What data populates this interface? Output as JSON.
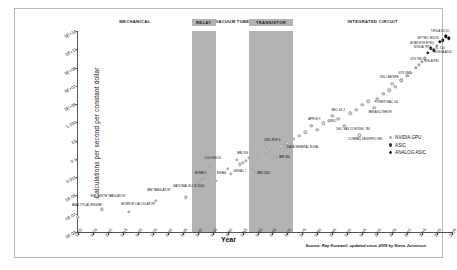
{
  "chart_data": {
    "type": "scatter",
    "title": "",
    "xlabel": "Year",
    "ylabel": "Calculations per second per constant dollar",
    "xlim": [
      1900,
      2025
    ],
    "ylim": [
      -9,
      13
    ],
    "grid": false,
    "yscale": "log",
    "legend_position": "right-middle",
    "source": "Source: Ray Kurzweil, updated since 2008 by Steve Jurvetson",
    "ytick_labels": [
      "1E+13",
      "1E+11",
      "1E+09",
      "1E+07",
      "1E+05",
      "1,000",
      "10",
      "0.1",
      "0.001",
      "1E-05",
      "1E-07",
      "1E-09"
    ],
    "ytick_exponents": [
      13,
      11,
      9,
      7,
      5,
      3,
      1,
      -1,
      -3,
      -5,
      -7,
      -9
    ],
    "xtick_labels": [
      "1900",
      "1905",
      "1910",
      "1915",
      "1920",
      "1925",
      "1930",
      "1935",
      "1940",
      "1945",
      "1950",
      "1955",
      "1960",
      "1965",
      "1970",
      "1975",
      "1980",
      "1985",
      "1990",
      "1995",
      "2000",
      "2005",
      "2010",
      "2015",
      "2020",
      "2025"
    ],
    "eras": [
      {
        "name": "MECHANICAL",
        "start": 1900,
        "end": 1938,
        "shaded": false
      },
      {
        "name": "RELAY",
        "start": 1938,
        "end": 1946,
        "shaded": true
      },
      {
        "name": "VACUUM TUBE",
        "start": 1946,
        "end": 1957,
        "shaded": false
      },
      {
        "name": "TRANSISTOR",
        "start": 1957,
        "end": 1972,
        "shaded": true
      },
      {
        "name": "INTEGRATED CIRCUIT",
        "start": 1972,
        "end": 2025,
        "shaded": false
      }
    ],
    "legend": [
      {
        "label": "NVIDIA GPU",
        "kind": "nvidia"
      },
      {
        "label": "ASIC",
        "kind": "asic"
      },
      {
        "label": "ANALOG ASIC",
        "kind": "analog"
      }
    ],
    "points": [
      {
        "name": "ANALYTICAL ENGINE",
        "year": 1900,
        "exp": -7.4,
        "kind": "plain",
        "lx": 1903,
        "ly": -6.1
      },
      {
        "name": "HOLLERITH TABULATOR",
        "year": 1908,
        "exp": -6.5,
        "kind": "plain",
        "lx": 1910,
        "ly": -5.2
      },
      {
        "name": "MONROE CALCULATOR",
        "year": 1917,
        "exp": -6.8,
        "kind": "plain",
        "lx": 1920,
        "ly": -6.0
      },
      {
        "name": "IBM TABULATOR",
        "year": 1926,
        "exp": -5.6,
        "kind": "plain",
        "lx": 1927,
        "ly": -4.5
      },
      {
        "name": "NATIONAL ELLIS 3000",
        "year": 1936,
        "exp": -5.2,
        "kind": "plain",
        "lx": 1937,
        "ly": -4.1
      },
      {
        "name": "BOMB II",
        "year": 1940,
        "exp": -3.6,
        "kind": "plain",
        "lx": 1941,
        "ly": -2.7
      },
      {
        "name": "",
        "year": 1941,
        "exp": -3.3,
        "kind": "plain"
      },
      {
        "name": "",
        "year": 1942,
        "exp": -3.1,
        "kind": "plain"
      },
      {
        "name": "ZUSE 3",
        "year": 1943,
        "exp": -2.9,
        "kind": "plain"
      },
      {
        "name": "COLOSSUS",
        "year": 1944,
        "exp": -1.8,
        "kind": "plain",
        "lx": 1945,
        "ly": -1.0
      },
      {
        "name": "ENIAC",
        "year": 1946,
        "exp": -3.4,
        "kind": "plain",
        "lx": 1948,
        "ly": -2.6
      },
      {
        "name": "",
        "year": 1949,
        "exp": -2.5,
        "kind": "plain"
      },
      {
        "name": "",
        "year": 1950,
        "exp": -2.1,
        "kind": "plain"
      },
      {
        "name": "UNIVAC I",
        "year": 1951,
        "exp": -2.6,
        "kind": "plain",
        "lx": 1954,
        "ly": -2.4
      },
      {
        "name": "IBM 704",
        "year": 1953,
        "exp": -1.1,
        "kind": "plain",
        "lx": 1955,
        "ly": -0.5
      },
      {
        "name": "",
        "year": 1954,
        "exp": -1.6,
        "kind": "plain"
      },
      {
        "name": "",
        "year": 1955,
        "exp": -1.4,
        "kind": "plain"
      },
      {
        "name": "",
        "year": 1956,
        "exp": -1.2,
        "kind": "plain"
      },
      {
        "name": "",
        "year": 1957,
        "exp": -0.9,
        "kind": "plain"
      },
      {
        "name": "",
        "year": 1958,
        "exp": -1.9,
        "kind": "plain"
      },
      {
        "name": "IBM 1620",
        "year": 1959,
        "exp": -2.4,
        "kind": "plain",
        "lx": 1962,
        "ly": -2.6
      },
      {
        "name": "",
        "year": 1960,
        "exp": -0.6,
        "kind": "plain"
      },
      {
        "name": "DEC PDP-4",
        "year": 1962,
        "exp": 0.6,
        "kind": "plain",
        "lx": 1965,
        "ly": 1.0
      },
      {
        "name": "",
        "year": 1963,
        "exp": -0.2,
        "kind": "plain"
      },
      {
        "name": "",
        "year": 1964,
        "exp": 0.1,
        "kind": "plain"
      },
      {
        "name": "IBM 360",
        "year": 1966,
        "exp": -0.8,
        "kind": "plain",
        "lx": 1969,
        "ly": -0.9
      },
      {
        "name": "",
        "year": 1968,
        "exp": 0.4,
        "kind": "plain"
      },
      {
        "name": "DATA GENERAL NOVA",
        "year": 1970,
        "exp": 0.7,
        "kind": "plain",
        "lx": 1975,
        "ly": 0.2
      },
      {
        "name": "",
        "year": 1972,
        "exp": 1.2,
        "kind": "plain"
      },
      {
        "name": "",
        "year": 1974,
        "exp": 1.5,
        "kind": "plain"
      },
      {
        "name": "",
        "year": 1976,
        "exp": 1.9,
        "kind": "plain"
      },
      {
        "name": "APPLE II",
        "year": 1978,
        "exp": 2.6,
        "kind": "plain",
        "lx": 1979,
        "ly": 3.3
      },
      {
        "name": "",
        "year": 1980,
        "exp": 2.2,
        "kind": "plain"
      },
      {
        "name": "SUN-1",
        "year": 1982,
        "exp": 2.9,
        "kind": "plain",
        "lx": 1985,
        "ly": 3.0
      },
      {
        "name": "",
        "year": 1984,
        "exp": 3.2,
        "kind": "plain"
      },
      {
        "name": "NEC SX-2",
        "year": 1985,
        "exp": 3.7,
        "kind": "plain",
        "lx": 1987,
        "ly": 4.2
      },
      {
        "name": "IBM PS/2",
        "year": 1987,
        "exp": 3.4,
        "kind": "plain"
      },
      {
        "name": "DEC VAX 11 MODEL 780",
        "year": 1989,
        "exp": 2.6,
        "kind": "plain",
        "lx": 1992,
        "ly": 2.2
      },
      {
        "name": "",
        "year": 1991,
        "exp": 4.0,
        "kind": "plain"
      },
      {
        "name": "",
        "year": 1993,
        "exp": 4.4,
        "kind": "plain"
      },
      {
        "name": "COMPAQ DESKPRO 386",
        "year": 1994,
        "exp": 1.6,
        "kind": "plain",
        "lx": 1996,
        "ly": 1.1
      },
      {
        "name": "",
        "year": 1995,
        "exp": 4.9,
        "kind": "plain"
      },
      {
        "name": "",
        "year": 1997,
        "exp": 5.3,
        "kind": "plain"
      },
      {
        "name": "IBM ASCI WHITE",
        "year": 1999,
        "exp": 4.6,
        "kind": "plain",
        "lx": 2001,
        "ly": 4.0
      },
      {
        "name": "POWER MAC G4",
        "year": 2000,
        "exp": 5.6,
        "kind": "plain",
        "lx": 2003,
        "ly": 5.1
      },
      {
        "name": "",
        "year": 2002,
        "exp": 6.1,
        "kind": "plain"
      },
      {
        "name": "",
        "year": 2004,
        "exp": 6.5,
        "kind": "plain"
      },
      {
        "name": "CELL BE/SPE",
        "year": 2005,
        "exp": 7.2,
        "kind": "plain",
        "lx": 2004,
        "ly": 7.9
      },
      {
        "name": "",
        "year": 2006,
        "exp": 6.9,
        "kind": "plain"
      },
      {
        "name": "GTX 580",
        "year": 2008,
        "exp": 7.6,
        "kind": "nvidia",
        "lx": 2009,
        "ly": 8.3
      },
      {
        "name": "",
        "year": 2010,
        "exp": 8.1,
        "kind": "nvidia"
      },
      {
        "name": "",
        "year": 2011,
        "exp": 8.4,
        "kind": "nvidia"
      },
      {
        "name": "GTX 980",
        "year": 2013,
        "exp": 9.0,
        "kind": "nvidia",
        "lx": 2013,
        "ly": 9.8
      },
      {
        "name": "",
        "year": 2014,
        "exp": 9.3,
        "kind": "nvidia"
      },
      {
        "name": "",
        "year": 2015,
        "exp": 9.6,
        "kind": "nvidia"
      },
      {
        "name": "TESLA P40",
        "year": 2016,
        "exp": 10.0,
        "kind": "nvidia",
        "lx": 2018,
        "ly": 9.6
      },
      {
        "name": "NVIDIA TPU",
        "year": 2017,
        "exp": 10.6,
        "kind": "asic",
        "lx": 2015,
        "ly": 11.1
      },
      {
        "name": "MOBILEYE EYEQ",
        "year": 2018,
        "exp": 11.1,
        "kind": "asic",
        "lx": 2015,
        "ly": 11.6
      },
      {
        "name": "KL 720",
        "year": 2019,
        "exp": 10.9,
        "kind": "asic",
        "lx": 2021,
        "ly": 11.0
      },
      {
        "name": "NVIDIA A100",
        "year": 2020,
        "exp": 11.4,
        "kind": "nvidia",
        "lx": 2022,
        "ly": 10.6
      },
      {
        "name": "MYTHIC M1076",
        "year": 2021,
        "exp": 11.8,
        "kind": "analog",
        "lx": 2017,
        "ly": 12.1
      },
      {
        "name": "TESLA DOJO",
        "year": 2023,
        "exp": 12.4,
        "kind": "analog",
        "lx": 2021,
        "ly": 12.9
      },
      {
        "name": "",
        "year": 2022,
        "exp": 12.0,
        "kind": "asic"
      },
      {
        "name": "",
        "year": 2024,
        "exp": 12.2,
        "kind": "analog"
      }
    ]
  }
}
